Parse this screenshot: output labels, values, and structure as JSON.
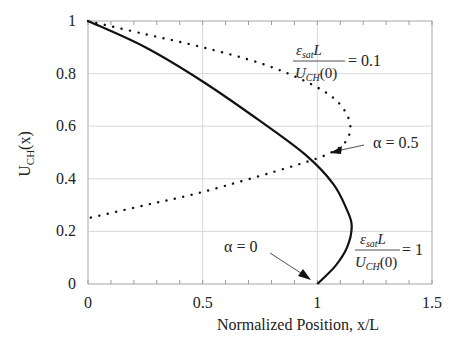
{
  "chart_data": {
    "type": "line",
    "title": "",
    "xlabel": "Normalized Position, x/L",
    "ylabel": "U_CH(x)",
    "xlim": [
      0,
      1.5
    ],
    "ylim": [
      0,
      1
    ],
    "xticks": [
      "0",
      "0.5",
      "1",
      "1.5"
    ],
    "yticks": [
      "0",
      "0.2",
      "0.4",
      "0.6",
      "0.8",
      "1"
    ],
    "grid": true,
    "series": [
      {
        "name": "εsat L / UCH(0) = 1",
        "style": "solid",
        "points": [
          [
            0,
            1
          ],
          [
            0.25,
            0.9
          ],
          [
            0.5,
            0.77
          ],
          [
            0.75,
            0.62
          ],
          [
            0.95,
            0.49
          ],
          [
            1.07,
            0.38
          ],
          [
            1.13,
            0.28
          ],
          [
            1.15,
            0.22
          ],
          [
            1.13,
            0.14
          ],
          [
            1.08,
            0.07
          ],
          [
            1.0,
            0
          ]
        ]
      },
      {
        "name": "εsat L / UCH(0) = 0.1",
        "style": "dotted",
        "points": [
          [
            0,
            1
          ],
          [
            0.25,
            0.95
          ],
          [
            0.5,
            0.9
          ],
          [
            0.75,
            0.84
          ],
          [
            0.95,
            0.77
          ],
          [
            1.08,
            0.7
          ],
          [
            1.14,
            0.62
          ],
          [
            1.13,
            0.55
          ],
          [
            1.06,
            0.5
          ],
          [
            0.9,
            0.45
          ],
          [
            0.5,
            0.35
          ],
          [
            0.25,
            0.3
          ],
          [
            0,
            0.25
          ]
        ]
      }
    ],
    "annotations": {
      "a05": "α = 0.5",
      "a0": "α = 0",
      "eq1_num": "ε",
      "eq1_sub": "sat",
      "eq_L": "L",
      "eq_den": "U",
      "eq_den_sub": "CH",
      "eq_den_arg": "(0)",
      "eq1_val": "= 0.1",
      "eq2_val": "= 1"
    }
  }
}
